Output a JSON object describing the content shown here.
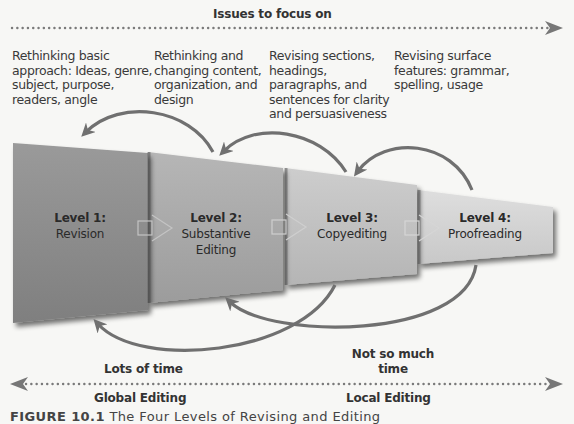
{
  "top_axis": {
    "label": "Issues to focus on",
    "direction": "right"
  },
  "issues": [
    {
      "lines": [
        "Rethinking basic",
        "approach: Ideas, genre,",
        "subject, purpose,",
        "readers, angle"
      ]
    },
    {
      "lines": [
        "Rethinking and",
        "changing content,",
        "organization, and",
        "design"
      ]
    },
    {
      "lines": [
        "Revising sections,",
        "headings,",
        "paragraphs, and",
        "sentences for clarity",
        "and persuasiveness"
      ]
    },
    {
      "lines": [
        "Revising surface",
        "features: grammar,",
        "spelling, usage"
      ]
    }
  ],
  "levels": [
    {
      "title": "Level 1:",
      "name_lines": [
        "Revision"
      ],
      "color": "#8e8e8e"
    },
    {
      "title": "Level 2:",
      "name_lines": [
        "Substantive",
        "Editing"
      ],
      "color": "#a9a9a9"
    },
    {
      "title": "Level 3:",
      "name_lines": [
        "Copyediting"
      ],
      "color": "#c0c0c0"
    },
    {
      "title": "Level 4:",
      "name_lines": [
        "Proofreading"
      ],
      "color": "#d2d2d2"
    }
  ],
  "time_labels": {
    "left": "Lots of time",
    "right_lines": [
      "Not so much",
      "time"
    ]
  },
  "bottom_axis": {
    "left_label": "Global Editing",
    "right_label": "Local Editing",
    "direction": "both"
  },
  "caption": {
    "prefix": "FIGURE 10.1",
    "text": "The Four Levels of Revising and Editing"
  },
  "colors": {
    "arrow": "#707070",
    "dots": "#7a7a7a",
    "text": "#333333",
    "background": "#f7f7f5"
  }
}
